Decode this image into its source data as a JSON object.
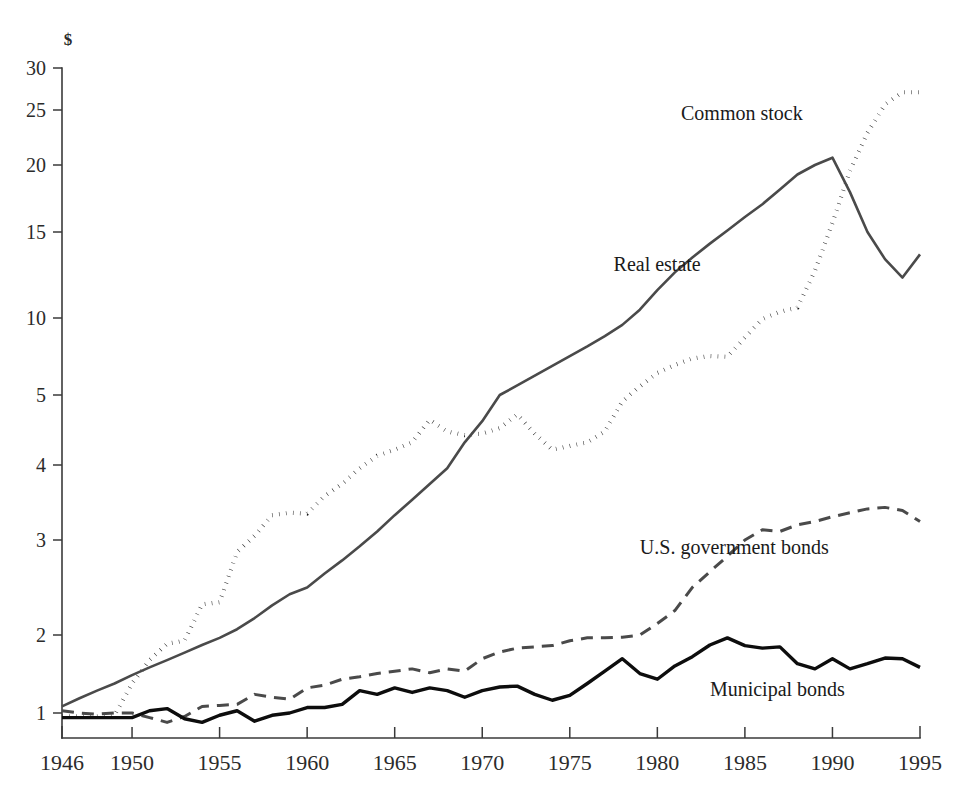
{
  "chart_data": {
    "type": "line",
    "title": "",
    "subtitle": "",
    "xlabel": "",
    "ylabel": "$",
    "y_axis_unit_label": "$",
    "y_scale": "log",
    "ylim": [
      0.82,
      32
    ],
    "xlim": [
      1946,
      1995
    ],
    "grid": false,
    "legend_position": "inline-annotations",
    "y_tick_labels": [
      "1",
      "2",
      "3",
      "4",
      "5",
      "10",
      "15",
      "20",
      "25",
      "30"
    ],
    "y_tick_values": [
      1,
      2,
      3,
      4,
      5,
      10,
      15,
      20,
      25,
      30
    ],
    "x_tick_labels": [
      "1946",
      "1950",
      "1955",
      "1960",
      "1965",
      "1970",
      "1975",
      "1980",
      "1985",
      "1990",
      "1995"
    ],
    "x_tick_values": [
      1946,
      1950,
      1955,
      1960,
      1965,
      1970,
      1975,
      1980,
      1985,
      1990,
      1995
    ],
    "x": [
      1946,
      1947,
      1948,
      1949,
      1950,
      1951,
      1952,
      1953,
      1954,
      1955,
      1956,
      1957,
      1958,
      1959,
      1960,
      1961,
      1962,
      1963,
      1964,
      1965,
      1966,
      1967,
      1968,
      1969,
      1970,
      1971,
      1972,
      1973,
      1974,
      1975,
      1976,
      1977,
      1978,
      1979,
      1980,
      1981,
      1982,
      1983,
      1984,
      1985,
      1986,
      1987,
      1988,
      1989,
      1990,
      1991,
      1992,
      1993,
      1994,
      1995
    ],
    "series": [
      {
        "name": "Common stock",
        "label": "Common stock",
        "line_style": "dotted",
        "color": "#1a1a1a",
        "label_x": 1988.3,
        "label_y": 24.0,
        "values": [
          0.97,
          0.97,
          0.97,
          0.98,
          1.3,
          1.6,
          1.85,
          1.9,
          2.28,
          2.3,
          2.85,
          3.05,
          3.3,
          3.33,
          3.32,
          3.55,
          3.72,
          3.95,
          4.12,
          4.2,
          4.3,
          4.62,
          4.45,
          4.4,
          4.42,
          4.5,
          4.7,
          4.42,
          4.2,
          4.25,
          4.3,
          4.45,
          4.9,
          5.4,
          6.1,
          6.55,
          6.95,
          7.1,
          7.05,
          8.4,
          9.9,
          10.3,
          10.5,
          12.5,
          15.6,
          19.5,
          22.8,
          25.6,
          27.0,
          27.0
        ]
      },
      {
        "name": "Real estate",
        "label": "Real estate",
        "line_style": "solid",
        "color": "#4a4a4a",
        "label_x": 1977.5,
        "label_y": 12.5,
        "values": [
          1.06,
          1.14,
          1.22,
          1.3,
          1.4,
          1.5,
          1.6,
          1.71,
          1.83,
          1.95,
          2.05,
          2.15,
          2.27,
          2.38,
          2.45,
          2.6,
          2.75,
          2.92,
          3.1,
          3.3,
          3.5,
          3.72,
          3.95,
          4.3,
          4.6,
          5.0,
          5.45,
          5.95,
          6.5,
          7.1,
          7.75,
          8.5,
          9.4,
          10.4,
          11.4,
          12.4,
          13.3,
          14.2,
          15.1,
          16.0,
          16.9,
          18.0,
          19.2,
          20.0,
          20.6,
          17.8,
          15.0,
          13.2,
          12.1,
          13.5
        ]
      },
      {
        "name": "U.S. government bonds",
        "label": "U.S. government bonds",
        "line_style": "dashed",
        "color": "#4a4a4a",
        "label_x": 1979.0,
        "label_y": 2.82,
        "values": [
          1.02,
          1.0,
          0.99,
          1.0,
          1.0,
          0.96,
          0.92,
          0.97,
          1.06,
          1.07,
          1.08,
          1.18,
          1.15,
          1.13,
          1.25,
          1.28,
          1.35,
          1.38,
          1.42,
          1.45,
          1.48,
          1.43,
          1.48,
          1.45,
          1.62,
          1.72,
          1.78,
          1.8,
          1.82,
          1.9,
          1.95,
          1.95,
          1.96,
          2.0,
          2.1,
          2.22,
          2.45,
          2.62,
          2.8,
          3.0,
          3.12,
          3.1,
          3.18,
          3.22,
          3.28,
          3.33,
          3.38,
          3.4,
          3.36,
          3.22
        ]
      },
      {
        "name": "Municipal bonds",
        "label": "Municipal bonds",
        "line_style": "solid-bold",
        "color": "#0d0d0d",
        "label_x": 1983.0,
        "label_y": 1.16,
        "values": [
          0.96,
          0.96,
          0.96,
          0.96,
          0.96,
          1.02,
          1.04,
          0.95,
          0.92,
          0.98,
          1.02,
          0.93,
          0.98,
          1.0,
          1.05,
          1.05,
          1.08,
          1.22,
          1.18,
          1.25,
          1.2,
          1.25,
          1.22,
          1.15,
          1.22,
          1.26,
          1.27,
          1.18,
          1.12,
          1.17,
          1.3,
          1.45,
          1.62,
          1.42,
          1.35,
          1.52,
          1.65,
          1.83,
          1.95,
          1.82,
          1.78,
          1.8,
          1.55,
          1.48,
          1.62,
          1.48,
          1.55,
          1.63,
          1.62,
          1.5
        ]
      }
    ]
  },
  "annotations": {
    "common_stock": "Common stock",
    "real_estate": "Real estate",
    "us_government_bonds": "U.S. government bonds",
    "municipal_bonds": "Municipal bonds"
  }
}
